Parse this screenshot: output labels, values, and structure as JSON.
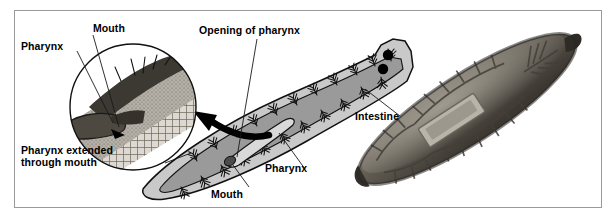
{
  "figure": {
    "kind": "biology-anatomy-figure",
    "panels": [
      {
        "id": "diagram",
        "type": "line-drawing",
        "position": "left"
      },
      {
        "id": "photograph",
        "type": "grayscale-photograph",
        "position": "right"
      }
    ]
  },
  "labels": {
    "mouth_inset": "Mouth",
    "pharynx_inset": "Pharynx",
    "pharynx_extended": "Pharynx extended\nthrough mouth",
    "opening_of_pharynx": "Opening of pharynx",
    "intestine": "Intestine",
    "pharynx_main": "Pharynx",
    "mouth_main": "Mouth"
  },
  "colors": {
    "background": "#ffffff",
    "frame": "#9a9a9a",
    "body_fill": "#c9c9c9",
    "gut_fill": "#9a9a9a",
    "outline": "#111111",
    "label_text": "#000000",
    "arrow": "#000000",
    "photo_body_dark": "#4a463f",
    "photo_body_mid": "#7d786e",
    "photo_body_light": "#a9a49a"
  },
  "structures": {
    "inset": {
      "shape": "circle",
      "depicts": "pharynx-extended-through-mouth-detail"
    },
    "eyespots": 2,
    "arrow": {
      "shape": "curved",
      "direction": "left",
      "meaning": "magnification-callout"
    },
    "photo_feature": "pharynx-chamber-visible"
  }
}
